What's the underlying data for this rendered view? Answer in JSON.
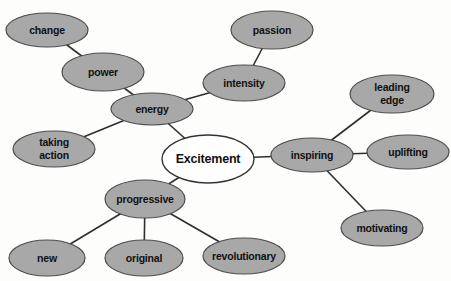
{
  "diagram": {
    "type": "mindmap",
    "canvas": {
      "width": 451,
      "height": 281,
      "background": "#fdfdfc"
    },
    "style": {
      "node_fill": "#a8a8a8",
      "node_stroke": "#4d4d4d",
      "node_stroke_width": 1.2,
      "center_fill": "#ffffff",
      "center_stroke": "#333333",
      "center_stroke_width": 1.4,
      "edge_color": "#2e2e2e",
      "edge_width": 1.6,
      "text_color": "#111111",
      "node_font_size": 10.5,
      "center_font_size": 12.5
    },
    "center_node": "excitement",
    "nodes": [
      {
        "id": "excitement",
        "label": "Excitement",
        "lines": [
          "Excitement"
        ],
        "cx": 208,
        "cy": 159,
        "rx": 46,
        "ry": 24,
        "center": true
      },
      {
        "id": "change",
        "label": "change",
        "lines": [
          "change"
        ],
        "cx": 47,
        "cy": 30,
        "rx": 41,
        "ry": 17,
        "center": false
      },
      {
        "id": "power",
        "label": "power",
        "lines": [
          "power"
        ],
        "cx": 103,
        "cy": 72,
        "rx": 41,
        "ry": 19,
        "center": false
      },
      {
        "id": "energy",
        "label": "energy",
        "lines": [
          "energy"
        ],
        "cx": 152,
        "cy": 109,
        "rx": 41,
        "ry": 16,
        "center": false
      },
      {
        "id": "passion",
        "label": "passion",
        "lines": [
          "passion"
        ],
        "cx": 272,
        "cy": 30,
        "rx": 41,
        "ry": 19,
        "center": false
      },
      {
        "id": "intensity",
        "label": "intensity",
        "lines": [
          "intensity"
        ],
        "cx": 244,
        "cy": 83,
        "rx": 41,
        "ry": 18,
        "center": false
      },
      {
        "id": "taking-action",
        "label": "taking action",
        "lines": [
          "taking",
          "action"
        ],
        "cx": 54,
        "cy": 149,
        "rx": 41,
        "ry": 18,
        "center": false
      },
      {
        "id": "inspiring",
        "label": "inspiring",
        "lines": [
          "inspiring"
        ],
        "cx": 312,
        "cy": 155,
        "rx": 41,
        "ry": 17,
        "center": false
      },
      {
        "id": "leading-edge",
        "label": "leading edge",
        "lines": [
          "leading",
          "edge"
        ],
        "cx": 392,
        "cy": 94,
        "rx": 42,
        "ry": 19,
        "center": false
      },
      {
        "id": "uplifting",
        "label": "uplifting",
        "lines": [
          "uplifting"
        ],
        "cx": 408,
        "cy": 152,
        "rx": 41,
        "ry": 17,
        "center": false
      },
      {
        "id": "motivating",
        "label": "motivating",
        "lines": [
          "motivating"
        ],
        "cx": 382,
        "cy": 228,
        "rx": 41,
        "ry": 18,
        "center": false
      },
      {
        "id": "progressive",
        "label": "progressive",
        "lines": [
          "progressive"
        ],
        "cx": 145,
        "cy": 199,
        "rx": 40,
        "ry": 19,
        "center": false
      },
      {
        "id": "new",
        "label": "new",
        "lines": [
          "new"
        ],
        "cx": 47,
        "cy": 258,
        "rx": 38,
        "ry": 18,
        "center": false
      },
      {
        "id": "original",
        "label": "original",
        "lines": [
          "original"
        ],
        "cx": 144,
        "cy": 258,
        "rx": 39,
        "ry": 18,
        "center": false
      },
      {
        "id": "revolutionary",
        "label": "revolutionary",
        "lines": [
          "revolutionary"
        ],
        "cx": 244,
        "cy": 256,
        "rx": 41,
        "ry": 18,
        "center": false
      }
    ],
    "edges": [
      [
        "change",
        "power"
      ],
      [
        "power",
        "energy"
      ],
      [
        "energy",
        "intensity"
      ],
      [
        "intensity",
        "passion"
      ],
      [
        "energy",
        "taking-action"
      ],
      [
        "energy",
        "excitement"
      ],
      [
        "excitement",
        "inspiring"
      ],
      [
        "inspiring",
        "leading-edge"
      ],
      [
        "inspiring",
        "uplifting"
      ],
      [
        "inspiring",
        "motivating"
      ],
      [
        "excitement",
        "progressive"
      ],
      [
        "progressive",
        "new"
      ],
      [
        "progressive",
        "original"
      ],
      [
        "progressive",
        "revolutionary"
      ]
    ]
  }
}
